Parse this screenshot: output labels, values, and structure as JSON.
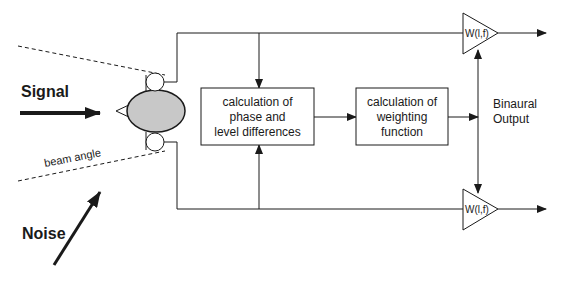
{
  "labels": {
    "signal": "Signal",
    "noise": "Noise",
    "beam_angle": "beam angle",
    "binaural_output_line1": "Binaural",
    "binaural_output_line2": "Output"
  },
  "blocks": [
    {
      "id": "phase-level",
      "lines": [
        "calculation of",
        "phase and",
        "level differences"
      ]
    },
    {
      "id": "weighting",
      "lines": [
        "calculation of",
        "weighting",
        "function"
      ]
    }
  ],
  "amplifiers": [
    {
      "id": "top",
      "label": "W(l,f)"
    },
    {
      "id": "bottom",
      "label": "W(l,f)"
    }
  ],
  "colors": {
    "line": "#1a1a1a",
    "head_fill": "#c8c8c8",
    "background": "#ffffff"
  }
}
